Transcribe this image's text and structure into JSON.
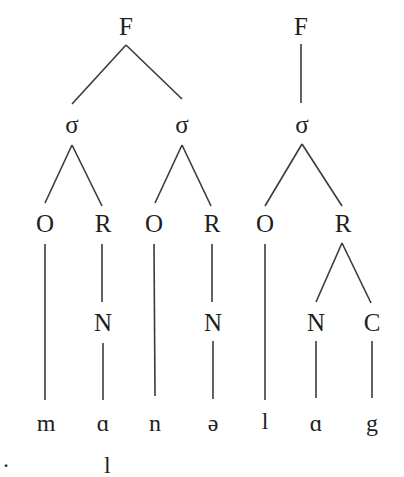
{
  "diagram": {
    "colors": {
      "line": "#3a3a3a",
      "text": "#1e1e1e",
      "background": "#ffffff"
    },
    "trees": [
      {
        "foot": "F",
        "syllables": [
          {
            "label": "σ",
            "onset": "O",
            "rime": "R",
            "nucleus": "N",
            "segments": [
              "m",
              "ɑ"
            ]
          },
          {
            "label": "σ",
            "onset": "O",
            "rime": "R",
            "nucleus": "N",
            "segments": [
              "n",
              "ə"
            ]
          }
        ]
      },
      {
        "foot": "F",
        "syllables": [
          {
            "label": "σ",
            "onset": "O",
            "rime": "R",
            "nucleus": "N",
            "coda": "C",
            "segments": [
              "l",
              "ɑ",
              "g"
            ]
          }
        ]
      }
    ],
    "nodes": [
      {
        "id": "F1",
        "text": "F",
        "x": 126,
        "y": 26
      },
      {
        "id": "F2",
        "text": "F",
        "x": 301,
        "y": 26
      },
      {
        "id": "s1",
        "text": "σ",
        "x": 72,
        "y": 124
      },
      {
        "id": "s2",
        "text": "σ",
        "x": 182,
        "y": 124
      },
      {
        "id": "s3",
        "text": "σ",
        "x": 302,
        "y": 124
      },
      {
        "id": "O1",
        "text": "O",
        "x": 45,
        "y": 223
      },
      {
        "id": "R1",
        "text": "R",
        "x": 103,
        "y": 223
      },
      {
        "id": "O2",
        "text": "O",
        "x": 154,
        "y": 223
      },
      {
        "id": "R2",
        "text": "R",
        "x": 212,
        "y": 223
      },
      {
        "id": "O3",
        "text": "O",
        "x": 265,
        "y": 223
      },
      {
        "id": "R3",
        "text": "R",
        "x": 343,
        "y": 223
      },
      {
        "id": "N1",
        "text": "N",
        "x": 103,
        "y": 322
      },
      {
        "id": "N2",
        "text": "N",
        "x": 213,
        "y": 322
      },
      {
        "id": "N3",
        "text": "N",
        "x": 316,
        "y": 322
      },
      {
        "id": "C3",
        "text": "C",
        "x": 372,
        "y": 322
      }
    ],
    "segments": [
      {
        "text": "m",
        "x": 46,
        "y": 423
      },
      {
        "text": "ɑ",
        "x": 103,
        "y": 423
      },
      {
        "text": "n",
        "x": 155,
        "y": 423
      },
      {
        "text": "ə",
        "x": 213,
        "y": 423
      },
      {
        "text": "l",
        "x": 265,
        "y": 421
      },
      {
        "text": "ɑ",
        "x": 316,
        "y": 423
      },
      {
        "text": "g",
        "x": 372,
        "y": 423
      }
    ],
    "edges": [
      [
        126,
        45,
        72,
        104
      ],
      [
        126,
        45,
        182,
        99
      ],
      [
        301,
        44,
        301,
        103
      ],
      [
        72,
        145,
        45,
        203
      ],
      [
        72,
        145,
        102,
        206
      ],
      [
        182,
        145,
        155,
        203
      ],
      [
        182,
        145,
        211,
        206
      ],
      [
        302,
        144,
        265,
        206
      ],
      [
        302,
        144,
        342,
        206
      ],
      [
        342,
        243,
        316,
        302
      ],
      [
        342,
        243,
        371,
        303
      ],
      [
        45,
        244,
        45,
        400
      ],
      [
        102,
        244,
        102,
        302
      ],
      [
        103,
        343,
        103,
        400
      ],
      [
        154,
        244,
        155,
        396
      ],
      [
        212,
        244,
        212,
        302
      ],
      [
        213,
        341,
        213,
        399
      ],
      [
        265,
        244,
        265,
        400
      ],
      [
        316,
        341,
        316,
        398
      ],
      [
        372,
        341,
        372,
        398
      ]
    ],
    "cropped_caption_fragments": [
      {
        "text": "·",
        "x": 2
      },
      {
        "text": "l",
        "x": 104
      }
    ]
  }
}
